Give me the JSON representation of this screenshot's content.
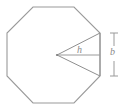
{
  "figure": {
    "type": "geometry-diagram",
    "shape": "regular-octagon",
    "labels": {
      "apothem": "h",
      "base": "b"
    },
    "colors": {
      "stroke": "#9a9a9a",
      "wedge_stroke": "#8f8f8f",
      "dimension_stroke": "#9a9a9a",
      "text": "#8a8a8a",
      "background": "#ffffff"
    },
    "geometry": {
      "octagon_points": "33,7 74,7 100,33 100,76 74,103 33,103 7,76 7,33",
      "center": {
        "x": 57,
        "y": 55
      },
      "wedge_vertex_top": {
        "x": 100,
        "y": 33
      },
      "wedge_vertex_bottom": {
        "x": 100,
        "y": 76
      },
      "apothem_line": {
        "x1": 57,
        "y1": 55,
        "x2": 100,
        "y2": 55
      },
      "dimension_line": {
        "x": 114,
        "y1": 33,
        "y2": 76
      },
      "dimension_tick_half_width": 4
    }
  }
}
